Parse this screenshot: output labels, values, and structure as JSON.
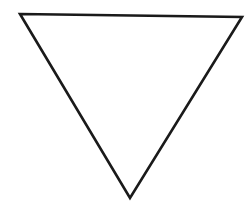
{
  "diagram": {
    "shape": "inverted-triangle",
    "fill": "#ffffff",
    "stroke": "#1a1a1a",
    "stroke_width": 2.6,
    "points": "20,14 242,17 130,198"
  }
}
